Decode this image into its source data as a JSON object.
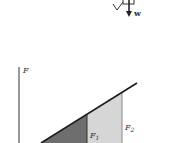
{
  "top_fragment": {
    "weight_label": "w"
  },
  "graph": {
    "y_axis_label": "F",
    "f1_label": "F",
    "f1_sub": "1",
    "f2_label": "F",
    "f2_sub": "2",
    "colors": {
      "dark_region": "#6e6e6e",
      "light_region": "#d6d6d6",
      "line": "#1a1a1a",
      "axis": "#555555"
    }
  }
}
